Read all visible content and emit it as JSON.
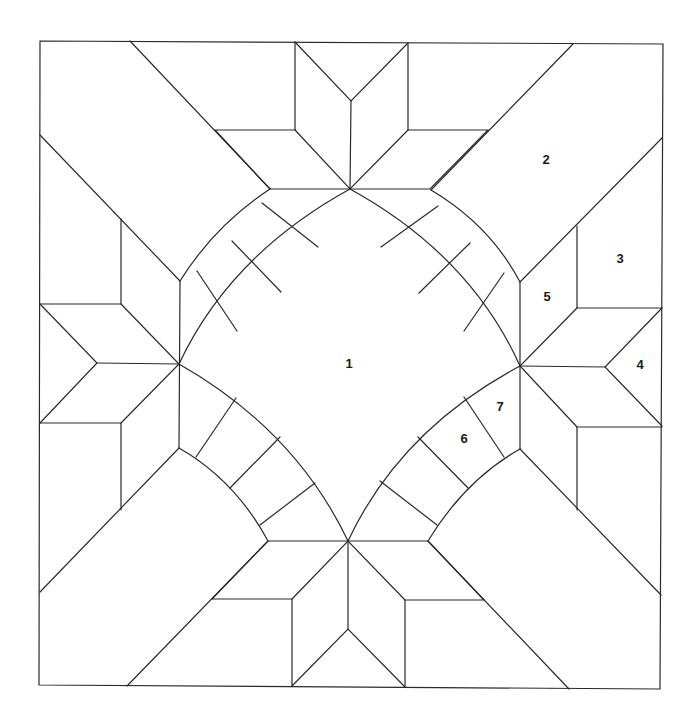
{
  "diagram": {
    "stroke_color": "#2a2a2a",
    "background": "#ffffff",
    "labels": [
      {
        "text": "1",
        "x": 349,
        "y": 365
      },
      {
        "text": "2",
        "x": 546,
        "y": 161
      },
      {
        "text": "3",
        "x": 620,
        "y": 260
      },
      {
        "text": "4",
        "x": 640,
        "y": 366
      },
      {
        "text": "5",
        "x": 547,
        "y": 298
      },
      {
        "text": "6",
        "x": 464,
        "y": 440
      },
      {
        "text": "7",
        "x": 500,
        "y": 408
      }
    ]
  }
}
